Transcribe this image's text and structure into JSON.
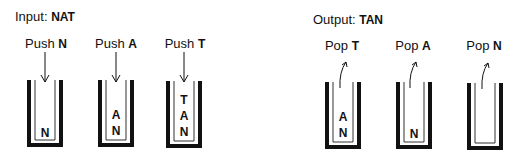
{
  "input": {
    "label": "Input:",
    "value": "NAT"
  },
  "output": {
    "label": "Output:",
    "value": "TAN"
  },
  "push_steps": [
    {
      "op": "Push",
      "char": "N",
      "stack": [
        "N"
      ]
    },
    {
      "op": "Push",
      "char": "A",
      "stack": [
        "A",
        "N"
      ]
    },
    {
      "op": "Push",
      "char": "T",
      "stack": [
        "T",
        "A",
        "N"
      ]
    }
  ],
  "pop_steps": [
    {
      "op": "Pop",
      "char": "T",
      "stack": [
        "A",
        "N"
      ]
    },
    {
      "op": "Pop",
      "char": "A",
      "stack": [
        "N"
      ]
    },
    {
      "op": "Pop",
      "char": "N",
      "stack": []
    }
  ]
}
